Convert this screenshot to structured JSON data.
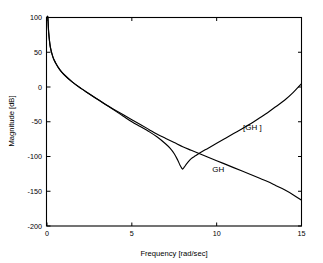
{
  "figure": {
    "background_color": "#ffffff",
    "line_color": "#000000"
  },
  "chart_data": {
    "type": "line",
    "title": "",
    "xlabel": "Frequency [rad/sec]",
    "ylabel": "Magnitude [dB]",
    "xlim": [
      0,
      15
    ],
    "ylim": [
      -200,
      100
    ],
    "xticks": [
      0,
      5,
      10,
      15
    ],
    "xtick_labels": [
      "0",
      "5",
      "10",
      "15"
    ],
    "yticks": [
      100,
      50,
      0,
      -50,
      -100,
      -150,
      -200
    ],
    "ytick_labels": [
      "100",
      "50",
      "0",
      "-50",
      "-100",
      "-150",
      "-200"
    ],
    "grid": false,
    "legend_position": "inline-annotations",
    "annotations": [
      {
        "text": "[GH ]",
        "x": 12.1,
        "y": -62
      },
      {
        "text": "GH",
        "x": 10.1,
        "y": -122
      }
    ],
    "series": [
      {
        "name": "[GH ]",
        "label": "[GH ]",
        "x": [
          0.05,
          0.1,
          0.2,
          0.35,
          0.5,
          0.75,
          1.0,
          1.5,
          2.0,
          2.5,
          3.0,
          3.5,
          4.0,
          4.5,
          5.0,
          5.5,
          6.0,
          6.5,
          7.0,
          7.25,
          7.5,
          7.7,
          7.85,
          7.95,
          8.0,
          8.1,
          8.25,
          8.5,
          8.75,
          9.0,
          9.5,
          10.0,
          10.5,
          11.0,
          11.5,
          12.0,
          12.5,
          13.0,
          13.5,
          14.0,
          14.5,
          15.0
        ],
        "y": [
          100,
          78,
          57,
          43,
          35,
          25,
          18,
          7,
          -2,
          -10,
          -18,
          -26,
          -34,
          -42,
          -50,
          -57,
          -64,
          -72,
          -82,
          -88,
          -96,
          -105,
          -113,
          -117,
          -118,
          -115,
          -110,
          -103,
          -99,
          -95,
          -88,
          -81,
          -74,
          -67,
          -60,
          -53,
          -45,
          -37,
          -28,
          -19,
          -8,
          5
        ]
      },
      {
        "name": "GH",
        "label": "GH",
        "x": [
          0.05,
          0.1,
          0.2,
          0.35,
          0.5,
          0.75,
          1.0,
          1.5,
          2.0,
          2.5,
          3.0,
          3.5,
          4.0,
          4.5,
          5.0,
          5.5,
          6.0,
          6.5,
          7.0,
          7.5,
          8.0,
          8.5,
          9.0,
          9.5,
          10.0,
          10.5,
          11.0,
          11.5,
          12.0,
          12.5,
          13.0,
          13.5,
          14.0,
          14.5,
          15.0
        ],
        "y": [
          100,
          78,
          57,
          43,
          35,
          25,
          18,
          7,
          -2,
          -10,
          -18,
          -26,
          -33,
          -40,
          -47,
          -54,
          -61,
          -68,
          -74,
          -80,
          -86,
          -91,
          -96,
          -101,
          -106,
          -111,
          -116,
          -121,
          -126,
          -131,
          -136,
          -142,
          -148,
          -155,
          -163
        ]
      }
    ]
  }
}
